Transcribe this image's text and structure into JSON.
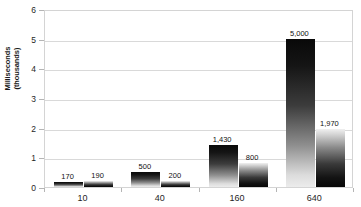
{
  "chart_data": {
    "type": "bar",
    "title": "",
    "xlabel": "",
    "ylabel": "Milliseconds\n(thousands)",
    "categories": [
      "10",
      "40",
      "160",
      "640"
    ],
    "series": [
      {
        "name": "Series 1",
        "values": [
          170,
          500,
          1430,
          5000
        ],
        "labels": [
          "170",
          "500",
          "1,430",
          "5,000"
        ]
      },
      {
        "name": "Series 2",
        "values": [
          190,
          200,
          800,
          1970
        ],
        "labels": [
          "190",
          "200",
          "800",
          "1,970"
        ]
      }
    ],
    "ylim": [
      0,
      6000
    ],
    "y_ticks": [
      0,
      1,
      2,
      3,
      4,
      5,
      6
    ],
    "y_tick_labels": [
      "0",
      "1",
      "2",
      "3",
      "4",
      "5",
      "6"
    ],
    "y_unit_scale": 1000,
    "grid": true,
    "legend": "none",
    "colors": {
      "series0_top": "#090909",
      "series0_bottom": "#ececec",
      "series1_top": "#f0f0f0",
      "series1_bottom": "#070707",
      "gridline": "#d9d9d9",
      "border": "#d4d4d4",
      "text": "#1f1f1f",
      "background": "#ffffff"
    }
  }
}
